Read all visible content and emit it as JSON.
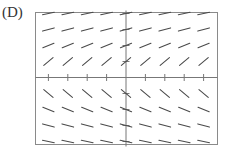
{
  "figure": {
    "label": "(D)",
    "colors": {
      "frame": "#8a8a8a",
      "axes": "#777777",
      "segments": "#4a4a4a",
      "background": "#ffffff"
    }
  },
  "chart_data": {
    "type": "slope_field",
    "differential_equation": "dy/dx = 1/y",
    "x_grid": [
      -4,
      -3,
      -2,
      -1,
      0,
      1,
      2,
      3,
      4
    ],
    "y_grid": [
      4,
      3,
      2,
      1,
      -1,
      -2,
      -3,
      -4
    ],
    "slopes_by_row": [
      {
        "y": 4,
        "slope": 0.25
      },
      {
        "y": 3,
        "slope": 0.333
      },
      {
        "y": 2,
        "slope": 0.5
      },
      {
        "y": 1,
        "slope": 1
      },
      {
        "y": -1,
        "slope": -1
      },
      {
        "y": -2,
        "slope": -0.5
      },
      {
        "y": -3,
        "slope": -0.333
      },
      {
        "y": -4,
        "slope": -0.25
      }
    ],
    "xlim": [
      -4.6,
      4.6
    ],
    "ylim": [
      -4.4,
      4.4
    ],
    "axes": {
      "x_ticks": [
        -4,
        -3,
        -2,
        -1,
        1,
        2,
        3,
        4
      ],
      "y_ticks": [
        -4,
        -3,
        -2,
        -1,
        1,
        2,
        3,
        4
      ]
    },
    "title": "",
    "xlabel": "",
    "ylabel": "",
    "grid": false,
    "frame": true
  }
}
